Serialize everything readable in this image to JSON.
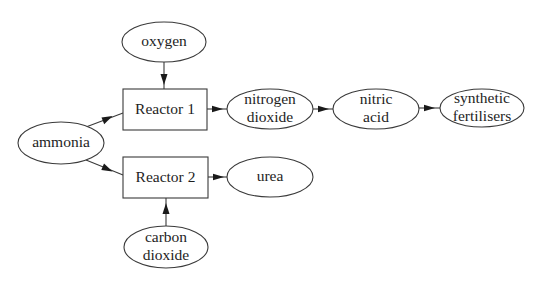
{
  "diagram": {
    "type": "flowchart",
    "nodes": {
      "oxygen": {
        "shape": "ellipse",
        "lines": [
          "oxygen"
        ],
        "cx": 164,
        "cy": 42,
        "rx": 42,
        "ry": 20
      },
      "reactor1": {
        "shape": "rect",
        "lines": [
          "Reactor 1"
        ],
        "x": 123,
        "y": 89,
        "w": 84,
        "h": 41
      },
      "ammonia": {
        "shape": "ellipse",
        "lines": [
          "ammonia"
        ],
        "cx": 61,
        "cy": 143,
        "rx": 43,
        "ry": 21
      },
      "reactor2": {
        "shape": "rect",
        "lines": [
          "Reactor 2"
        ],
        "x": 123,
        "y": 157,
        "w": 85,
        "h": 41
      },
      "carbon_dioxide": {
        "shape": "ellipse",
        "lines": [
          "carbon",
          "dioxide"
        ],
        "cx": 166,
        "cy": 247,
        "rx": 42,
        "ry": 21
      },
      "nitrogen_dioxide": {
        "shape": "ellipse",
        "lines": [
          "nitrogen",
          "dioxide"
        ],
        "cx": 270,
        "cy": 109,
        "rx": 43,
        "ry": 20
      },
      "nitric_acid": {
        "shape": "ellipse",
        "lines": [
          "nitric",
          "acid"
        ],
        "cx": 376,
        "cy": 109,
        "rx": 43,
        "ry": 20
      },
      "synthetic_fertilisers": {
        "shape": "ellipse",
        "lines": [
          "synthetic",
          "fertilisers"
        ],
        "cx": 482,
        "cy": 108,
        "rx": 42,
        "ry": 19
      },
      "urea": {
        "shape": "ellipse",
        "lines": [
          "urea"
        ],
        "cx": 270,
        "cy": 177,
        "rx": 43,
        "ry": 20
      }
    },
    "edges": [
      {
        "from": "oxygen",
        "to": "reactor1"
      },
      {
        "from": "ammonia",
        "to": "reactor1"
      },
      {
        "from": "ammonia",
        "to": "reactor2"
      },
      {
        "from": "carbon_dioxide",
        "to": "reactor2"
      },
      {
        "from": "reactor1",
        "to": "nitrogen_dioxide"
      },
      {
        "from": "nitrogen_dioxide",
        "to": "nitric_acid"
      },
      {
        "from": "nitric_acid",
        "to": "synthetic_fertilisers"
      },
      {
        "from": "reactor2",
        "to": "urea"
      }
    ],
    "colors": {
      "stroke": "#3a3a3a",
      "text": "#1e1e1e",
      "arrowhead": "#1a1a1a",
      "background": "#ffffff"
    }
  }
}
